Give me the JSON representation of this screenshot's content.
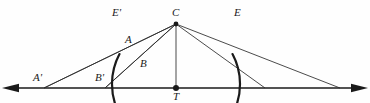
{
  "figure": {
    "type": "geometry-diagram",
    "background_color": "#fefefe",
    "stroke_color": "#1a1a1a",
    "baseline": {
      "name": "horizontal-tangent-line",
      "y": 88,
      "x_start": 10,
      "x_end": 360,
      "arrow_left": true,
      "arrow_right": true,
      "stroke_width": 1.6
    },
    "arc": {
      "name": "circular-arc",
      "center_x": 176,
      "center_y": 24,
      "radius": 64,
      "start_label": "E'",
      "end_label": "E",
      "stroke_width": 2.2
    },
    "center_point": {
      "x": 176,
      "y": 24,
      "label": "C"
    },
    "tangent_point": {
      "x": 176,
      "y": 88,
      "label": "T"
    },
    "rays": [
      {
        "name": "ray-C-to-A-prime",
        "x1": 176,
        "y1": 24,
        "x2": 44,
        "y2": 88
      },
      {
        "name": "ray-C-to-B-prime",
        "x1": 176,
        "y1": 24,
        "x2": 105,
        "y2": 88
      },
      {
        "name": "ray-C-to-T",
        "x1": 176,
        "y1": 24,
        "x2": 176,
        "y2": 88
      },
      {
        "name": "ray-C-to-right-inner",
        "x1": 176,
        "y1": 24,
        "x2": 265,
        "y2": 88
      },
      {
        "name": "ray-C-to-right-outer",
        "x1": 176,
        "y1": 24,
        "x2": 340,
        "y2": 88
      }
    ],
    "chords": [
      {
        "name": "chord-A-prime-to-A-upper",
        "x1": 44,
        "y1": 88,
        "x2": 176,
        "y2": 24
      },
      {
        "name": "chord-B-prime-upper",
        "x1": 105,
        "y1": 88,
        "x2": 176,
        "y2": 24
      }
    ],
    "labels": [
      {
        "id": "label-E-prime",
        "text": "E'",
        "x": 112,
        "y": 7
      },
      {
        "id": "label-C",
        "text": "C",
        "x": 172,
        "y": 7
      },
      {
        "id": "label-E",
        "text": "E",
        "x": 234,
        "y": 7
      },
      {
        "id": "label-A",
        "text": "A",
        "x": 125,
        "y": 34
      },
      {
        "id": "label-B",
        "text": "B",
        "x": 140,
        "y": 58
      },
      {
        "id": "label-A-prime",
        "text": "A'",
        "x": 33,
        "y": 72
      },
      {
        "id": "label-B-prime",
        "text": "B'",
        "x": 95,
        "y": 72
      },
      {
        "id": "label-T",
        "text": "T",
        "x": 173,
        "y": 91
      }
    ]
  }
}
